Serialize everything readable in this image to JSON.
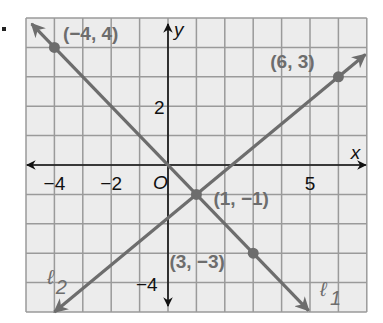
{
  "chart_data": {
    "type": "line",
    "title": "",
    "xlabel": "x",
    "ylabel": "y",
    "origin_label": "O",
    "xlim": [
      -5,
      7
    ],
    "ylim": [
      -5,
      5
    ],
    "grid": true,
    "x_ticks": [
      {
        "value": -4,
        "label": "−4"
      },
      {
        "value": -2,
        "label": "−2"
      },
      {
        "value": 5,
        "label": "5"
      }
    ],
    "y_ticks": [
      {
        "value": 2,
        "label": "2"
      },
      {
        "value": -4,
        "label": "−4"
      }
    ],
    "series": [
      {
        "name": "ℓ1",
        "label_main": "ℓ",
        "label_sub": "1",
        "equation": "y = -x",
        "points": [
          {
            "x": -4,
            "y": 4,
            "label": "(−4, 4)"
          },
          {
            "x": 3,
            "y": -3,
            "label": "(3, −3)"
          }
        ]
      },
      {
        "name": "ℓ2",
        "label_main": "ℓ",
        "label_sub": "2",
        "equation": "y = (4/5)x - 9/5",
        "points": [
          {
            "x": 6,
            "y": 3,
            "label": "(6, 3)"
          }
        ]
      }
    ],
    "intersection": {
      "x": 1,
      "y": -1,
      "label": "(1, −1)"
    }
  },
  "colors": {
    "line": "#6d6d6d",
    "grid": "#9a9a9a",
    "grid_bg": "#ececec",
    "axis": "#111111",
    "point_label": "#6d6d6d"
  }
}
